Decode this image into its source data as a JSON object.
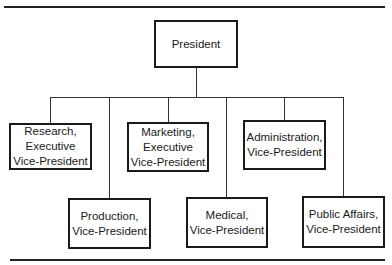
{
  "chart": {
    "type": "org-chart",
    "root": {
      "id": "president",
      "label": "President"
    },
    "children": [
      {
        "id": "research",
        "label": "Research,\nExecutive\nVice-President"
      },
      {
        "id": "production",
        "label": "Production,\nVice-President"
      },
      {
        "id": "marketing",
        "label": "Marketing,\nExecutive\nVice-President"
      },
      {
        "id": "medical",
        "label": "Medical,\nVice-President"
      },
      {
        "id": "administration",
        "label": "Administration,\nVice-President"
      },
      {
        "id": "public-affairs",
        "label": "Public Affairs,\nVice-President"
      }
    ]
  }
}
